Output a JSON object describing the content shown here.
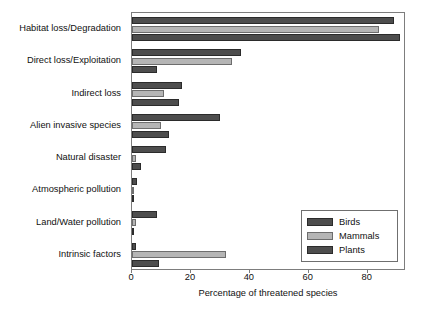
{
  "chart_data": {
    "type": "bar",
    "orientation": "horizontal",
    "title": "",
    "xlabel": "Percentage of threatened species",
    "ylabel": "",
    "xlim": [
      0,
      93
    ],
    "xticks": [
      0,
      20,
      40,
      60,
      80
    ],
    "xtick_labels": [
      "0",
      "20",
      "40",
      "60",
      "80"
    ],
    "grid": false,
    "legend_position": "lower right",
    "categories": [
      "Habitat loss/Degradation",
      "Direct loss/Exploitation",
      "Indirect loss",
      "Alien invasive species",
      "Natural disaster",
      "Atmospheric pollution",
      "Land/Water pollution",
      "Intrinsic factors"
    ],
    "series": [
      {
        "name": "Birds",
        "color": "#4d4d4d",
        "values": [
          89,
          37,
          17,
          30,
          11.5,
          1.8,
          8.5,
          1.3
        ]
      },
      {
        "name": "Mammals",
        "color": "#b5b5b5",
        "values": [
          84,
          34,
          11,
          10,
          1.5,
          0.3,
          1.3,
          32
        ]
      },
      {
        "name": "Plants",
        "color": "#4d4d4d",
        "values": [
          91,
          8.5,
          16,
          12.5,
          3,
          0.3,
          0.8,
          9
        ]
      }
    ]
  },
  "legend": {
    "entries": [
      "Birds",
      "Mammals",
      "Plants"
    ]
  }
}
